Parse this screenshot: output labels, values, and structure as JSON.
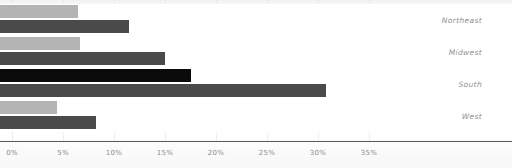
{
  "chart_data": {
    "type": "bar",
    "orientation": "horizontal",
    "title": "",
    "subtitle": "",
    "xlabel": "",
    "ylabel": "",
    "categories": [
      "Northeast",
      "Midwest",
      "South",
      "West"
    ],
    "series": [
      {
        "name": "series-1",
        "color": "#b4b4b4",
        "values": [
          6.5,
          6.7,
          17.5,
          4.4
        ]
      },
      {
        "name": "series-2",
        "color": "#4a4a4a",
        "values": [
          11.5,
          15.0,
          30.8,
          8.2
        ]
      }
    ],
    "bars": [
      {
        "category": "Northeast",
        "series": "series-1",
        "value": 6.5,
        "color": "#b4b4b4"
      },
      {
        "category": "Northeast",
        "series": "series-2",
        "value": 11.5,
        "color": "#4a4a4a"
      },
      {
        "category": "Midwest",
        "series": "series-1",
        "value": 6.7,
        "color": "#b4b4b4"
      },
      {
        "category": "Midwest",
        "series": "series-2",
        "value": 15.0,
        "color": "#4a4a4a"
      },
      {
        "category": "South",
        "series": "series-1",
        "value": 17.5,
        "color": "#0b0b0b"
      },
      {
        "category": "South",
        "series": "series-2",
        "value": 30.8,
        "color": "#4a4a4a"
      },
      {
        "category": "West",
        "series": "series-1",
        "value": 4.4,
        "color": "#b4b4b4"
      },
      {
        "category": "West",
        "series": "series-2",
        "value": 8.2,
        "color": "#4a4a4a"
      }
    ],
    "xlim": [
      0,
      37
    ],
    "xticks": [
      0,
      5,
      10,
      15,
      20,
      25,
      30,
      35
    ],
    "xtick_labels": [
      "0%",
      "5%",
      "10%",
      "15%",
      "20%",
      "25%",
      "30%",
      "35%"
    ],
    "grid": true,
    "grid_axis": "x",
    "grid_style": "dotted",
    "legend": false,
    "legend_position": "none",
    "value_format": "percent"
  },
  "axis": {
    "line_color": "#5a5a5a",
    "tick_color": "#8c8c8c"
  },
  "labels": {
    "color": "#8f8f8f",
    "band_color": "#ffffff"
  }
}
